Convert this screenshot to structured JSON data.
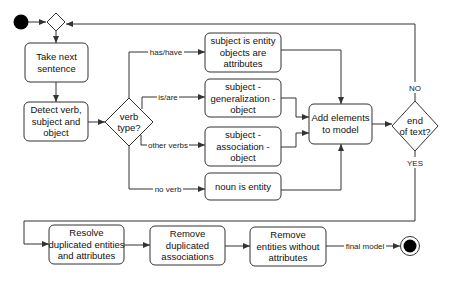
{
  "diagram": {
    "nodes": {
      "start": {
        "type": "initial"
      },
      "merge": {
        "type": "merge-diamond"
      },
      "take_next": {
        "lines": [
          "Take next",
          "sentence"
        ]
      },
      "detect": {
        "lines": [
          "Detect verb,",
          "subject and",
          "object"
        ]
      },
      "verb_type": {
        "lines": [
          "verb",
          "type?"
        ]
      },
      "entity_attr": {
        "lines": [
          "subject is entity",
          "objects are",
          "attributes"
        ]
      },
      "generalization": {
        "lines": [
          "subject -",
          "generalization -",
          "object"
        ]
      },
      "association": {
        "lines": [
          "subject -",
          "association -",
          "object"
        ]
      },
      "noun_entity": {
        "lines": [
          "noun is entity"
        ]
      },
      "add_elements": {
        "lines": [
          "Add elements",
          "to model"
        ]
      },
      "end_of_text": {
        "lines": [
          "end",
          "of text?"
        ]
      },
      "resolve": {
        "lines": [
          "Resolve",
          "duplicated entities",
          "and attributes"
        ]
      },
      "remove_assoc": {
        "lines": [
          "Remove",
          "duplicated",
          "associations"
        ]
      },
      "remove_entities": {
        "lines": [
          "Remove",
          "entities without",
          "attributes"
        ]
      },
      "end": {
        "type": "final"
      }
    },
    "edge_labels": {
      "has_have": "has/have",
      "is_are": "is/are",
      "other_verbs": "other verbs",
      "no_verb": "no verb",
      "no": "NO",
      "yes": "YES",
      "final_model": "final model"
    },
    "colors": {
      "stroke": "#333333",
      "fill": "#ffffff",
      "text": "#111111",
      "terminal": "#000000"
    }
  }
}
